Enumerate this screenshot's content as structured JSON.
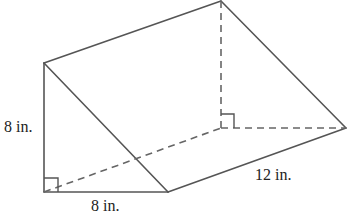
{
  "diagram": {
    "type": "triangular-prism",
    "labels": {
      "height": "8 in.",
      "base": "8 in.",
      "length": "12 in."
    },
    "colors": {
      "line": "#555555",
      "text": "#222222"
    }
  }
}
